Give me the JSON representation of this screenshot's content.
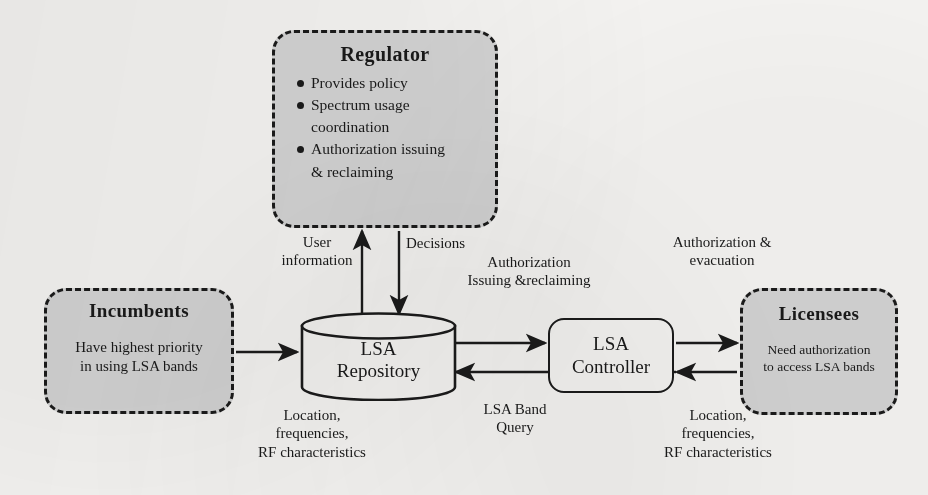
{
  "diagram": {
    "colors": {
      "box_fill": "#d4d4d4",
      "stroke": "#1b1b1b",
      "background": "#f6f5f3"
    },
    "nodes": {
      "regulator": {
        "title": "Regulator",
        "bullets": [
          "Provides policy",
          "Spectrum usage",
          "coordination",
          "Authorization issuing",
          "& reclaiming"
        ],
        "shape": "rounded-dashed-rectangle"
      },
      "incumbents": {
        "title": "Incumbents",
        "subtitle": "Have highest priority\nin using LSA bands",
        "shape": "rounded-dashed-rectangle"
      },
      "licensees": {
        "title": "Licensees",
        "subtitle": "Need authorization\nto access LSA bands",
        "shape": "rounded-dashed-rectangle"
      },
      "repository": {
        "label": "LSA\nRepository",
        "shape": "cylinder"
      },
      "controller": {
        "label": "LSA\nController",
        "shape": "rounded-rectangle"
      }
    },
    "edges": {
      "user_information": "User\ninformation",
      "decisions": "Decisions",
      "authorization_issuing_reclaiming": "Authorization\nIssuing &reclaiming",
      "authorization_evacuation": "Authorization &\nevacuation",
      "location_left": "Location,\nfrequencies,\nRF characteristics",
      "lsa_band_query": "LSA Band\nQuery",
      "location_right": "Location,\nfrequencies,\nRF characteristics"
    }
  }
}
